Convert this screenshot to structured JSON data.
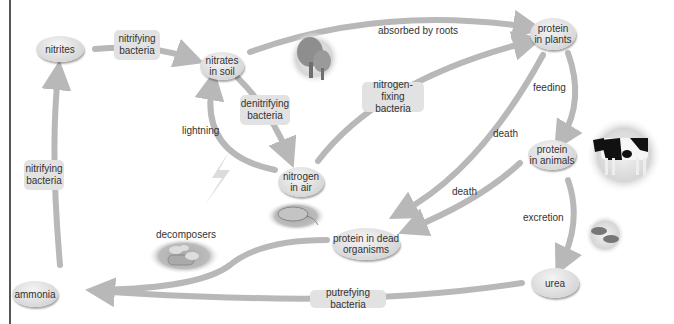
{
  "diagram": {
    "nodes": {
      "nitrites": "nitrites",
      "nitrates_in_soil": "nitrates\nin soil",
      "protein_in_plants": "protein\nin plants",
      "protein_in_animals": "protein\nin animals",
      "nitrogen_in_air": "nitrogen\nin air",
      "protein_in_dead_organisms": "protein in dead\norganisms",
      "ammonia": "ammonia",
      "urea": "urea"
    },
    "process_boxes": {
      "nitrifying_bacteria_top": "nitrifying\nbacteria",
      "nitrifying_bacteria_left": "nitrifying\nbacteria",
      "denitrifying_bacteria": "denitrifying\nbacteria",
      "nitrogen_fixing_bacteria": "nitrogen-fixing\nbacteria",
      "putrefying_bacteria": "putrefying bacteria"
    },
    "edge_labels": {
      "absorbed_by_roots": "absorbed by roots",
      "feeding": "feeding",
      "death_plants": "death",
      "death_animals": "death",
      "excretion": "excretion",
      "lightning": "lightning",
      "decomposers": "decomposers"
    },
    "illustrations": [
      "trees",
      "cow",
      "mouse",
      "mushrooms-on-log",
      "droppings",
      "lightning-bolt"
    ],
    "colors": {
      "arrow": "#b8b8b8",
      "node_fill": "#dcdcdc",
      "box_fill": "#e2e2e2",
      "text": "#333333",
      "frame": "#555555"
    }
  }
}
